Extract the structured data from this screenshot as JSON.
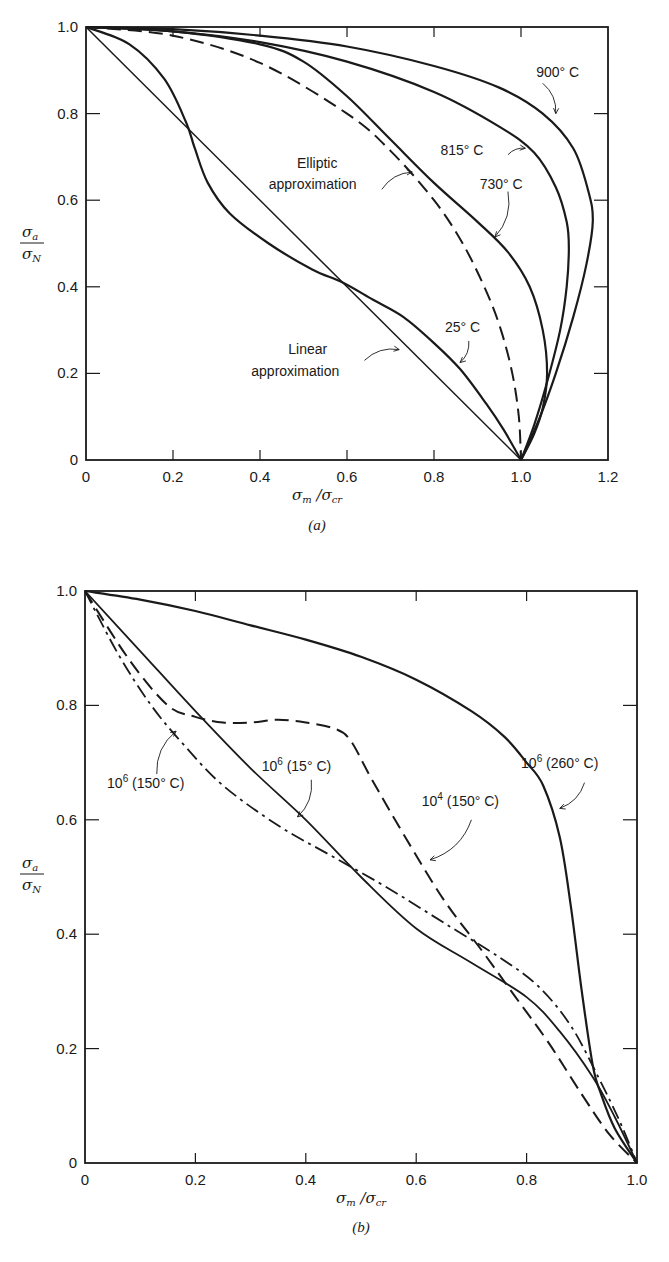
{
  "chart_data": [
    {
      "id": "a",
      "type": "line",
      "caption": "(a)",
      "title": "",
      "xlabel": "σm / σcr",
      "ylabel": "σa / σN",
      "xlim": [
        0,
        1.2
      ],
      "ylim": [
        0,
        1.0
      ],
      "grid": false,
      "xticks": [
        "0",
        "0.2",
        "0.4",
        "0.6",
        "0.8",
        "1.0",
        "1.2"
      ],
      "yticks": [
        "0",
        "0.2",
        "0.4",
        "0.6",
        "0.8",
        "1.0"
      ],
      "series": [
        {
          "name": "900° C",
          "style": "solid",
          "width": 2.2,
          "x": [
            0,
            0.2,
            0.4,
            0.6,
            0.8,
            0.95,
            1.05,
            1.12,
            1.155,
            1.165,
            1.15,
            1.12,
            1.08,
            1.04,
            1.0
          ],
          "y": [
            1.0,
            0.995,
            0.98,
            0.955,
            0.91,
            0.86,
            0.8,
            0.72,
            0.62,
            0.55,
            0.45,
            0.33,
            0.2,
            0.09,
            0.0
          ]
        },
        {
          "name": "815° C",
          "style": "solid",
          "width": 2.2,
          "x": [
            0,
            0.2,
            0.4,
            0.6,
            0.8,
            0.95,
            1.03,
            1.08,
            1.105,
            1.11,
            1.105,
            1.09,
            1.06,
            1.03,
            1.0
          ],
          "y": [
            1.0,
            0.99,
            0.965,
            0.92,
            0.85,
            0.77,
            0.71,
            0.63,
            0.55,
            0.49,
            0.4,
            0.3,
            0.18,
            0.08,
            0.0
          ]
        },
        {
          "name": "730° C",
          "style": "solid",
          "width": 2.2,
          "x": [
            0,
            0.2,
            0.4,
            0.5,
            0.6,
            0.7,
            0.8,
            0.9,
            0.97,
            1.02,
            1.05,
            1.06,
            1.05,
            1.03,
            1.0
          ],
          "y": [
            1.0,
            0.99,
            0.96,
            0.92,
            0.84,
            0.74,
            0.64,
            0.55,
            0.48,
            0.4,
            0.3,
            0.2,
            0.12,
            0.06,
            0.0
          ]
        },
        {
          "name": "Elliptic approximation",
          "style": "dashed",
          "width": 2.0,
          "x": [
            0,
            0.2,
            0.4,
            0.6,
            0.7,
            0.8,
            0.866,
            0.92,
            0.954,
            0.98,
            0.995,
            1.0
          ],
          "y": [
            1.0,
            0.98,
            0.917,
            0.8,
            0.714,
            0.6,
            0.5,
            0.39,
            0.3,
            0.2,
            0.1,
            0.0
          ]
        },
        {
          "name": "25° C",
          "style": "solid",
          "width": 2.2,
          "x": [
            0,
            0.1,
            0.18,
            0.23,
            0.25,
            0.28,
            0.33,
            0.42,
            0.52,
            0.59,
            0.66,
            0.73,
            0.8,
            0.86,
            0.92,
            0.96,
            1.0
          ],
          "y": [
            1.0,
            0.96,
            0.88,
            0.78,
            0.72,
            0.64,
            0.57,
            0.5,
            0.44,
            0.41,
            0.37,
            0.33,
            0.27,
            0.21,
            0.13,
            0.07,
            0.0
          ]
        },
        {
          "name": "Linear approximation",
          "style": "solid",
          "width": 1.5,
          "x": [
            0,
            1.0
          ],
          "y": [
            1.0,
            0.0
          ]
        }
      ],
      "annotations": [
        {
          "text": "900° C",
          "x": 1.035,
          "y": 0.885
        },
        {
          "text": "815° C",
          "x": 0.815,
          "y": 0.705
        },
        {
          "text": "730° C",
          "x": 0.905,
          "y": 0.625
        },
        {
          "text": "Elliptic",
          "x": 0.485,
          "y": 0.675
        },
        {
          "text": "approximation",
          "x": 0.42,
          "y": 0.625
        },
        {
          "text": "25° C",
          "x": 0.825,
          "y": 0.295
        },
        {
          "text": "Linear",
          "x": 0.465,
          "y": 0.245
        },
        {
          "text": "approximation",
          "x": 0.38,
          "y": 0.195
        }
      ],
      "arrows": [
        [
          1.05,
          0.87,
          1.08,
          0.8
        ],
        [
          0.97,
          0.705,
          1.01,
          0.72
        ],
        [
          0.97,
          0.62,
          0.94,
          0.515
        ],
        [
          0.68,
          0.625,
          0.75,
          0.665
        ],
        [
          0.88,
          0.275,
          0.86,
          0.225
        ],
        [
          0.64,
          0.23,
          0.72,
          0.255
        ]
      ]
    },
    {
      "id": "b",
      "type": "line",
      "caption": "(b)",
      "title": "",
      "xlabel": "σm / σcr",
      "ylabel": "σa / σN",
      "xlim": [
        0,
        1.0
      ],
      "ylim": [
        0,
        1.0
      ],
      "grid": false,
      "xticks": [
        "0",
        "0.2",
        "0.4",
        "0.6",
        "0.8",
        "1.0"
      ],
      "yticks": [
        "0",
        "0.2",
        "0.4",
        "0.6",
        "0.8",
        "1.0"
      ],
      "series": [
        {
          "name": "10^6 (260° C)",
          "style": "solid",
          "width": 2.2,
          "x": [
            0,
            0.1,
            0.2,
            0.3,
            0.4,
            0.5,
            0.6,
            0.7,
            0.76,
            0.8,
            0.83,
            0.86,
            0.88,
            0.9,
            0.92,
            0.935,
            0.96,
            1.0
          ],
          "y": [
            1.0,
            0.985,
            0.965,
            0.94,
            0.915,
            0.885,
            0.845,
            0.79,
            0.745,
            0.7,
            0.66,
            0.57,
            0.45,
            0.3,
            0.17,
            0.12,
            0.06,
            0.0
          ]
        },
        {
          "name": "10^4 (150° C)",
          "style": "dashed",
          "width": 2.0,
          "x": [
            0,
            0.08,
            0.15,
            0.2,
            0.25,
            0.3,
            0.35,
            0.4,
            0.45,
            0.48,
            0.52,
            0.58,
            0.65,
            0.72,
            0.78,
            0.84,
            0.9,
            0.95,
            1.0
          ],
          "y": [
            1.0,
            0.88,
            0.8,
            0.78,
            0.77,
            0.77,
            0.775,
            0.77,
            0.76,
            0.74,
            0.67,
            0.57,
            0.46,
            0.37,
            0.29,
            0.21,
            0.12,
            0.05,
            0.0
          ]
        },
        {
          "name": "10^6 (15° C)",
          "style": "solid",
          "width": 1.8,
          "x": [
            0,
            0.1,
            0.2,
            0.3,
            0.4,
            0.5,
            0.6,
            0.7,
            0.8,
            0.86,
            0.92,
            0.96,
            1.0
          ],
          "y": [
            1.0,
            0.895,
            0.79,
            0.69,
            0.6,
            0.5,
            0.41,
            0.35,
            0.29,
            0.23,
            0.15,
            0.08,
            0.0
          ]
        },
        {
          "name": "10^6 (150° C)",
          "style": "dashdot",
          "width": 1.8,
          "x": [
            0,
            0.06,
            0.12,
            0.18,
            0.25,
            0.35,
            0.45,
            0.55,
            0.65,
            0.75,
            0.82,
            0.88,
            0.93,
            0.97,
            1.0
          ],
          "y": [
            1.0,
            0.89,
            0.8,
            0.73,
            0.66,
            0.59,
            0.535,
            0.48,
            0.42,
            0.36,
            0.31,
            0.24,
            0.15,
            0.07,
            0.0
          ]
        }
      ],
      "annotations": [
        {
          "text": "10",
          "sup": "6",
          "rest": " (150° C)",
          "x": 0.04,
          "y": 0.655
        },
        {
          "text": "10",
          "sup": "6",
          "rest": " (15° C)",
          "x": 0.32,
          "y": 0.685
        },
        {
          "text": "10",
          "sup": "4",
          "rest": " (150° C)",
          "x": 0.61,
          "y": 0.625
        },
        {
          "text": "10",
          "sup": "6",
          "rest": " (260° C)",
          "x": 0.79,
          "y": 0.69
        }
      ],
      "arrows": [
        [
          0.13,
          0.68,
          0.165,
          0.755
        ],
        [
          0.41,
          0.67,
          0.385,
          0.605
        ],
        [
          0.7,
          0.6,
          0.625,
          0.53
        ],
        [
          0.905,
          0.665,
          0.86,
          0.62
        ]
      ]
    }
  ],
  "figures": {
    "a": {
      "caption": "(a)",
      "ylabel_num": "σ",
      "ylabel_num_sub": "a",
      "ylabel_den": "σ",
      "ylabel_den_sub": "N",
      "xlabel_num": "σ",
      "xlabel_num_sub": "m",
      "xlabel_den": "σ",
      "xlabel_den_sub": "cr"
    },
    "b": {
      "caption": "(b)",
      "ylabel_num": "σ",
      "ylabel_num_sub": "a",
      "ylabel_den": "σ",
      "ylabel_den_sub": "N",
      "xlabel_num": "σ",
      "xlabel_num_sub": "m",
      "xlabel_den": "σ",
      "xlabel_den_sub": "cr"
    }
  }
}
